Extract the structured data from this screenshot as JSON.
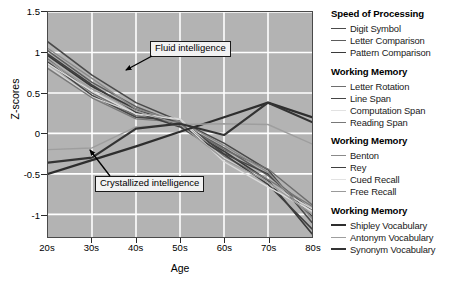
{
  "chart_data": {
    "type": "line",
    "title": "",
    "xlabel": "Age",
    "ylabel": "Z-scores",
    "grid": true,
    "legend_position": "right",
    "categories": [
      "20s",
      "30s",
      "40s",
      "50s",
      "60s",
      "70s",
      "80s"
    ],
    "x_tick_labels": [
      "20s",
      "30s",
      "40s",
      "50s",
      "60s",
      "70s",
      "80s"
    ],
    "y_tick_labels": [
      "1.5",
      "1",
      "0.5",
      "0",
      "-0.5",
      "-1"
    ],
    "y_tick_values": [
      1.5,
      1,
      0.5,
      0,
      -0.5,
      -1
    ],
    "ylim": [
      -1.28,
      1.5
    ],
    "xlim": [
      0,
      6
    ],
    "series": [
      {
        "name": "Digit Symbol",
        "group": "Speed of Processing",
        "color": "#4a4a4a",
        "width": 1.6,
        "values": [
          1.13,
          0.72,
          0.38,
          0.15,
          -0.12,
          -0.45,
          -1.1
        ]
      },
      {
        "name": "Letter Comparison",
        "group": "Speed of Processing",
        "color": "#5c5c5c",
        "width": 1.5,
        "values": [
          1.02,
          0.63,
          0.33,
          0.12,
          -0.18,
          -0.52,
          -0.95
        ]
      },
      {
        "name": "Pattern Comparison",
        "group": "Speed of Processing",
        "color": "#3a3a3a",
        "width": 1.7,
        "values": [
          0.96,
          0.58,
          0.3,
          0.1,
          -0.22,
          -0.58,
          -1.24
        ]
      },
      {
        "name": "Letter Rotation",
        "group": "Working Memory",
        "color": "#6e6e6e",
        "width": 1.4,
        "values": [
          0.92,
          0.5,
          0.22,
          0.13,
          -0.2,
          -0.44,
          -0.88
        ]
      },
      {
        "name": "Line Span",
        "group": "Working Memory",
        "color": "#454545",
        "width": 1.5,
        "values": [
          0.88,
          0.47,
          0.2,
          0.16,
          -0.25,
          -0.5,
          -1.02
        ]
      },
      {
        "name": "Computation Span",
        "group": "Working Memory",
        "color": "#d6d6d6",
        "width": 1.3,
        "values": [
          0.83,
          0.45,
          0.25,
          0.18,
          -0.3,
          -0.62,
          -0.93
        ]
      },
      {
        "name": "Reading Span",
        "group": "Working Memory",
        "color": "#787878",
        "width": 1.4,
        "values": [
          0.8,
          0.44,
          0.18,
          0.14,
          -0.28,
          -0.57,
          -0.9
        ]
      },
      {
        "name": "Benton",
        "group": "Working Memory",
        "color": "#8a8a8a",
        "width": 1.3,
        "values": [
          1.05,
          0.68,
          0.3,
          0.15,
          -0.15,
          -0.48,
          -1.05
        ]
      },
      {
        "name": "Rey",
        "group": "Working Memory",
        "color": "#3f3f3f",
        "width": 1.6,
        "values": [
          0.98,
          0.6,
          0.26,
          0.08,
          -0.26,
          -0.63,
          -1.18
        ]
      },
      {
        "name": "Cued Recall",
        "group": "Working Memory",
        "color": "#dcdcdc",
        "width": 1.3,
        "values": [
          0.86,
          0.52,
          0.24,
          0.17,
          -0.35,
          -0.66,
          -0.96
        ]
      },
      {
        "name": "Free Recall",
        "group": "Working Memory",
        "color": "#9a9a9a",
        "width": 1.3,
        "values": [
          0.9,
          0.55,
          0.28,
          0.11,
          -0.32,
          -0.6,
          -1.0
        ]
      },
      {
        "name": "Shipley Vocabulary",
        "group": "Working Memory",
        "color": "#2e2e2e",
        "width": 2.2,
        "values": [
          -0.5,
          -0.33,
          -0.16,
          0.02,
          0.2,
          0.38,
          0.2
        ]
      },
      {
        "name": "Antonym Vocabulary",
        "group": "Working Memory",
        "color": "#9e9e9e",
        "width": 1.4,
        "values": [
          -0.2,
          -0.18,
          0.08,
          0.11,
          0.12,
          0.11,
          -0.13
        ]
      },
      {
        "name": "Synonym Vocabulary",
        "group": "Working Memory",
        "color": "#333333",
        "width": 2.2,
        "values": [
          -0.36,
          -0.3,
          0.06,
          0.12,
          -0.02,
          0.38,
          0.14
        ]
      }
    ],
    "annotations": [
      {
        "text": "Fluid intelligence",
        "box_x": 150,
        "box_y": 41,
        "arrow_to_x": 125,
        "arrow_to_y": 70
      },
      {
        "text": "Crystallized intelligence",
        "box_x": 95,
        "box_y": 176,
        "arrow_to_x": 88,
        "arrow_to_y": 150
      }
    ]
  },
  "axes": {
    "y_title": "Z-scores",
    "x_title": "Age"
  },
  "legend": {
    "groups": [
      {
        "title": "Speed of Processing",
        "items": [
          {
            "label": "Digit Symbol",
            "color": "#4a4a4a",
            "width": "1.8px"
          },
          {
            "label": "Letter Comparison",
            "color": "#5c5c5c",
            "width": "1.6px"
          },
          {
            "label": "Pattern Comparison",
            "color": "#3a3a3a",
            "width": "1.9px"
          }
        ]
      },
      {
        "title": "Working Memory",
        "items": [
          {
            "label": "Letter Rotation",
            "color": "#6e6e6e",
            "width": "1.6px"
          },
          {
            "label": "Line Span",
            "color": "#454545",
            "width": "1.8px"
          },
          {
            "label": "Computation Span",
            "color": "#e2e2e2",
            "width": "1.4px"
          },
          {
            "label": "Reading Span",
            "color": "#787878",
            "width": "1.6px"
          }
        ]
      },
      {
        "title": "Working Memory",
        "items": [
          {
            "label": "Benton",
            "color": "#8a8a8a",
            "width": "1.5px"
          },
          {
            "label": "Rey",
            "color": "#3f3f3f",
            "width": "1.9px"
          },
          {
            "label": "Cued Recall",
            "color": "#e2e2e2",
            "width": "1.4px"
          },
          {
            "label": "Free Recall",
            "color": "#9a9a9a",
            "width": "1.5px"
          }
        ]
      },
      {
        "title": "Working Memory",
        "items": [
          {
            "label": "Shipley Vocabulary",
            "color": "#2e2e2e",
            "width": "2.6px"
          },
          {
            "label": "Antonym Vocabulary",
            "color": "#9e9e9e",
            "width": "1.5px"
          },
          {
            "label": "Synonym Vocabulary",
            "color": "#333333",
            "width": "2.6px"
          }
        ]
      }
    ]
  },
  "colors": {
    "plot_background": "#b3b3b3",
    "gridline": "#ffffff",
    "axis": "#4a4a4a",
    "text": "#000000",
    "annotation_box_fill": "#f2f2f2"
  }
}
